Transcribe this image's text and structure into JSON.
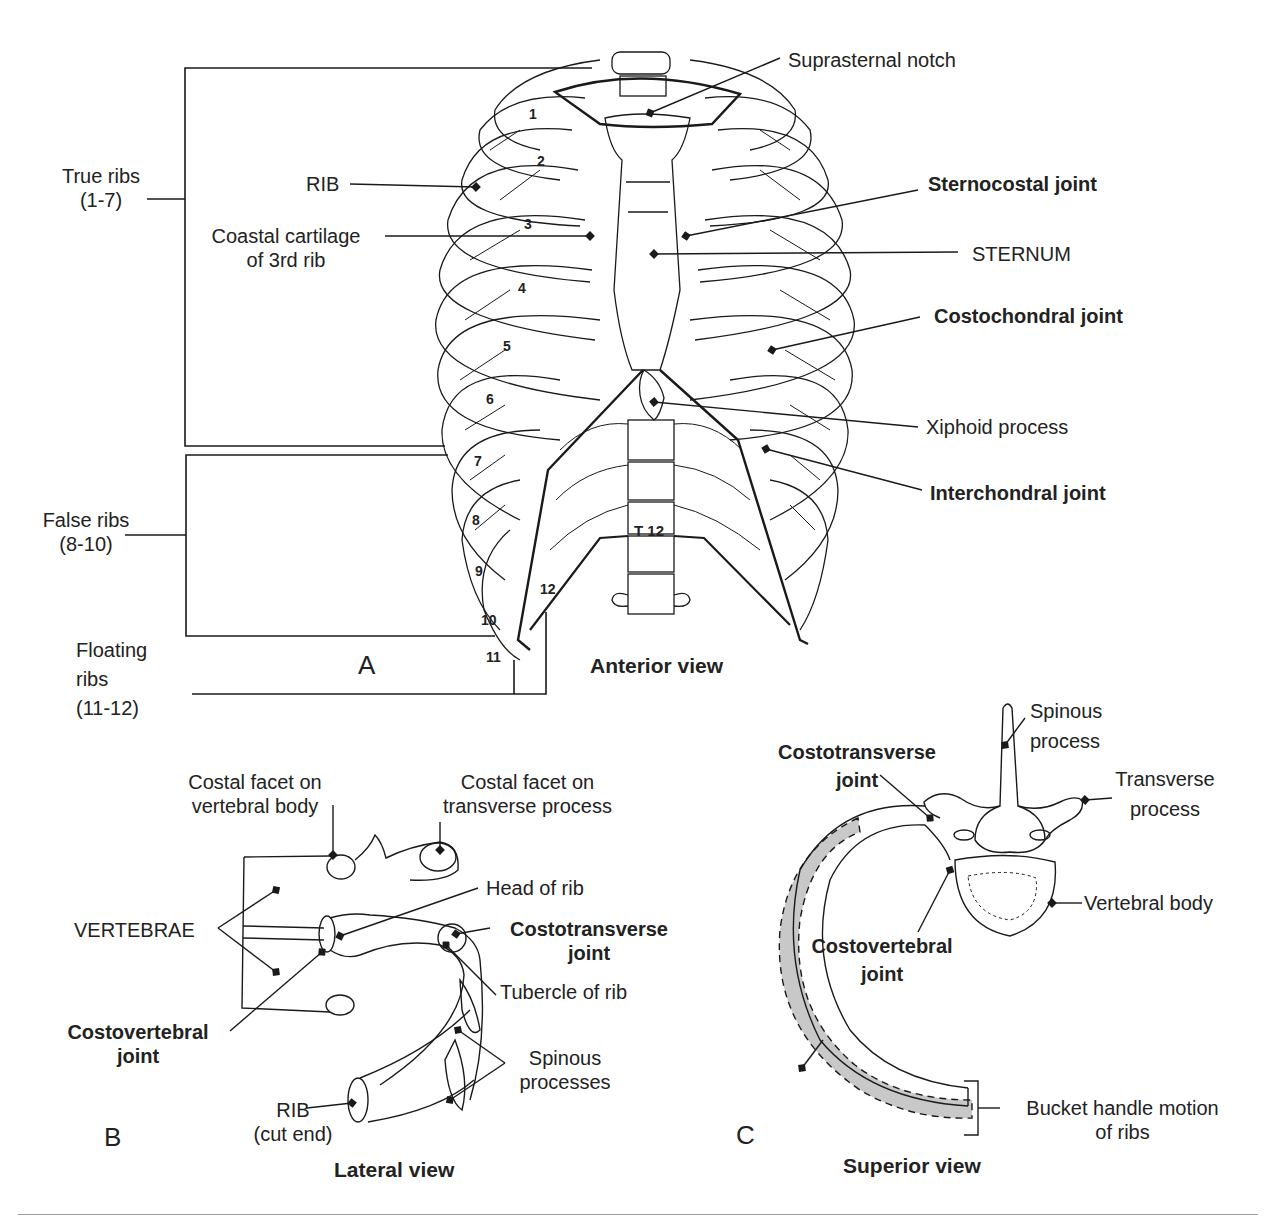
{
  "figure": {
    "panel_a": {
      "letter": "A",
      "caption": "Anterior view",
      "groups": {
        "true_ribs": [
          "True ribs",
          "(1-7)"
        ],
        "false_ribs": [
          "False ribs",
          "(8-10)"
        ],
        "floating_ribs": [
          "Floating",
          "ribs",
          "(11-12)"
        ]
      },
      "labels": {
        "rib": "RIB",
        "coastal_cartilage": [
          "Coastal cartilage",
          "of 3rd rib"
        ],
        "suprasternal_notch": "Suprasternal notch",
        "sternocostal_joint": "Sternocostal joint",
        "sternum": "STERNUM",
        "costochondral_joint": "Costochondral joint",
        "xiphoid_process": "Xiphoid process",
        "interchondral_joint": "Interchondral joint",
        "vertebra": "T 12"
      },
      "rib_numbers": [
        "1",
        "2",
        "3",
        "4",
        "5",
        "6",
        "7",
        "8",
        "9",
        "10",
        "11",
        "12"
      ]
    },
    "panel_b": {
      "letter": "B",
      "caption": "Lateral view",
      "labels": {
        "costal_facet_body": [
          "Costal facet on",
          "vertebral body"
        ],
        "costal_facet_transverse": [
          "Costal facet on",
          "transverse process"
        ],
        "vertebrae": "VERTEBRAE",
        "head_of_rib": "Head of rib",
        "costotransverse_joint": [
          "Costotransverse",
          "joint"
        ],
        "tubercle_of_rib": "Tubercle of rib",
        "costovertebral_joint": [
          "Costovertebral",
          "joint"
        ],
        "spinous_processes": [
          "Spinous",
          "processes"
        ],
        "rib_cut_end": [
          "RIB",
          "(cut end)"
        ]
      }
    },
    "panel_c": {
      "letter": "C",
      "caption": "Superior view",
      "labels": {
        "spinous_process": [
          "Spinous",
          "process"
        ],
        "costotransverse_joint": [
          "Costotransverse",
          "joint"
        ],
        "transverse_process": [
          "Transverse",
          "process"
        ],
        "vertebral_body": "Vertebral body",
        "costovertebral_joint": [
          "Costovertebral",
          "joint"
        ],
        "bucket_handle": [
          "Bucket handle motion",
          "of ribs"
        ]
      }
    },
    "colors": {
      "line": "#1a1a1a",
      "shade": "#c8c8c8",
      "rule": "#9a9a9a"
    }
  }
}
